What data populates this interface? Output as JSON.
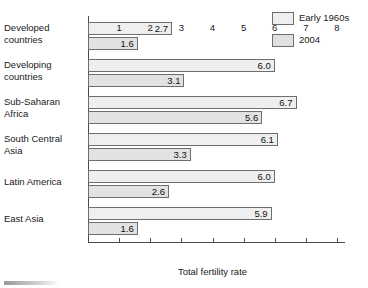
{
  "chart_data": {
    "type": "bar",
    "orientation": "horizontal",
    "title": "",
    "xlabel": "Total fertility rate",
    "ylabel": "",
    "xlim": [
      0,
      8
    ],
    "xticks": [
      "1",
      "2",
      "3",
      "4",
      "5",
      "6",
      "7",
      "8"
    ],
    "grid": false,
    "legend_position": "top-right",
    "categories": [
      "Developed countries",
      "Developing countries",
      "Sub-Saharan Africa",
      "South Central Asia",
      "Latin America",
      "East Asia"
    ],
    "series": [
      {
        "name": "Early 1960s",
        "color": "#efefef",
        "values": [
          2.7,
          6.0,
          6.7,
          6.1,
          6.0,
          5.9
        ]
      },
      {
        "name": "2004",
        "color": "#e2e2e2",
        "values": [
          1.6,
          3.1,
          5.6,
          3.3,
          2.6,
          1.6
        ]
      }
    ],
    "data_labels": [
      {
        "category": "Developed countries",
        "early_1960s": "2.7",
        "y2004": "1.6"
      },
      {
        "category": "Developing countries",
        "early_1960s": "6.0",
        "y2004": "3.1"
      },
      {
        "category": "Sub-Saharan Africa",
        "early_1960s": "6.7",
        "y2004": "5.6"
      },
      {
        "category": "South Central Asia",
        "early_1960s": "6.1",
        "y2004": "3.3"
      },
      {
        "category": "Latin America",
        "early_1960s": "6.0",
        "y2004": "2.6"
      },
      {
        "category": "East Asia",
        "early_1960s": "5.9",
        "y2004": "1.6"
      }
    ]
  },
  "legend": {
    "items": [
      {
        "label": "Early 1960s",
        "swatch": "#efefef"
      },
      {
        "label": "2004",
        "swatch": "#e2e2e2"
      }
    ]
  },
  "category_labels": [
    {
      "line1": "Developed",
      "line2": "countries"
    },
    {
      "line1": "Developing",
      "line2": "countries"
    },
    {
      "line1": "Sub-Saharan",
      "line2": "Africa"
    },
    {
      "line1": "South Central",
      "line2": "Asia"
    },
    {
      "line1": "Latin America",
      "line2": ""
    },
    {
      "line1": "East Asia",
      "line2": ""
    }
  ],
  "axis": {
    "x_title": "Total fertility rate",
    "ticks": [
      "1",
      "2",
      "3",
      "4",
      "5",
      "6",
      "7",
      "8"
    ]
  }
}
